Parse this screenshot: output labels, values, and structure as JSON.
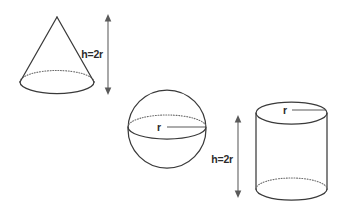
{
  "figure": {
    "background_color": "#ffffff",
    "stroke_color": "#3a3a3a",
    "hidden_stroke_color": "#6e6e6e",
    "label_color": "#2b2b2b",
    "shapes": [
      {
        "id": "cone",
        "name": "cone",
        "height_label": "h=2r",
        "apex": {
          "x": 57,
          "y": 17
        },
        "base_center": {
          "x": 57,
          "y": 82
        },
        "base_rx": 37,
        "base_ry": 11.5,
        "dimension": {
          "axis_x": 108,
          "top_y": 16,
          "bottom_y": 93,
          "label": "h=2r",
          "label_x": 103,
          "label_y": 55,
          "label_anchor": "end"
        }
      },
      {
        "id": "sphere",
        "name": "sphere",
        "radius_label": "r",
        "center": {
          "x": 167,
          "y": 129
        },
        "radius": 39,
        "equator_rx": 39,
        "equator_ry": 12,
        "radius_line": {
          "from_x": 167,
          "to_x": 206,
          "y": 127,
          "label": "r",
          "label_x": 159,
          "label_y": 126
        }
      },
      {
        "id": "cylinder",
        "name": "cylinder",
        "height_label": "h=2r",
        "radius_label": "r",
        "center_x": 291.5,
        "rx": 35.5,
        "ry": 11,
        "top_y": 113,
        "bottom_y": 189,
        "radius_line": {
          "from_x": 292,
          "to_x": 326,
          "y": 110,
          "label": "r",
          "label_x": 284,
          "label_y": 110
        },
        "dimension": {
          "axis_x": 238,
          "top_y": 117,
          "bottom_y": 196,
          "label": "h=2r",
          "label_x": 233,
          "label_y": 160,
          "label_anchor": "end"
        }
      }
    ]
  }
}
